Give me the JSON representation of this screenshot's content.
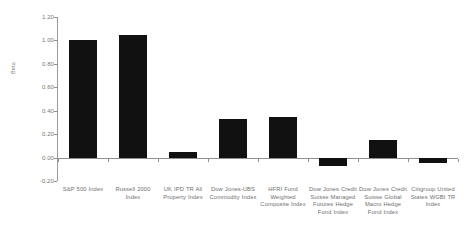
{
  "chart_data": {
    "type": "bar",
    "title": "",
    "xlabel": "",
    "ylabel": "Beta",
    "ylim": [
      -0.2,
      1.2
    ],
    "ytick_step": 0.2,
    "ytick_labels": [
      "1.20",
      "1.00",
      "0.80",
      "0.60",
      "0.40",
      "0.20",
      "0.00",
      "-0.20"
    ],
    "ytick_values": [
      1.2,
      1.0,
      0.8,
      0.6,
      0.4,
      0.2,
      0.0,
      -0.2
    ],
    "grid": false,
    "legend": "none",
    "bar_color": "#111111",
    "axis_color": "#8f8f8f",
    "categories": [
      "S&P 500 Index",
      "Russell 2000 Index",
      "UK IPD TR All Property Index",
      "Dow Jones-UBS Commodity Index",
      "HFRI Fund Weighted Composite Index",
      "Dow Jones Credit Suisse Managed Futures Hedge Fund Index",
      "Dow Jones Credit Suisse Global Macro Hedge Fund Index",
      "Citigroup United States WGBI TR Index"
    ],
    "values": [
      1.0,
      1.05,
      0.05,
      0.33,
      0.35,
      -0.07,
      0.15,
      -0.05
    ]
  }
}
